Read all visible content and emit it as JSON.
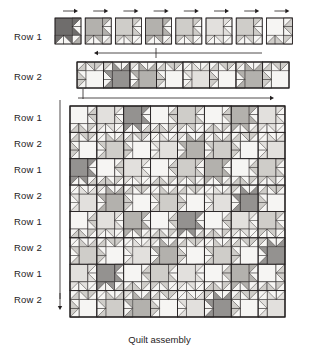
{
  "caption": "Quilt assembly",
  "row_labels": [
    {
      "text": "Row 1"
    },
    {
      "text": "Row 2"
    },
    {
      "text": "Row 1"
    },
    {
      "text": "Row 2"
    },
    {
      "text": "Row 1"
    },
    {
      "text": "Row 2"
    },
    {
      "text": "Row 1"
    },
    {
      "text": "Row 2"
    },
    {
      "text": "Row 1"
    },
    {
      "text": "Row 2"
    }
  ],
  "top_strips": [
    {
      "label": "Row 1",
      "blocks": 8,
      "orientation": "upright",
      "arrow": "right-per-block"
    },
    {
      "label": "Row 2",
      "blocks": 8,
      "orientation": "rotated-180",
      "arrow": "left-long"
    }
  ],
  "palette": {
    "white": "#f6f5f3",
    "light": "#e2e0dd",
    "light_mid": "#cfcdc9",
    "mid": "#b3b1ad",
    "mid_dark": "#949290",
    "dark": "#6f6d6c",
    "darkest": "#4a4848",
    "line": "#231f20",
    "ink": "#262223"
  },
  "quilt": {
    "columns": 8,
    "rows": 8,
    "block_label_pattern": [
      "Row 1",
      "Row 2"
    ],
    "arrow_top": "right",
    "arrow_left": "down"
  },
  "chart_data": {
    "type": "diagram",
    "title": "Quilt assembly",
    "grid": {
      "cols": 8,
      "rows": 8
    },
    "row1_tones": [
      6,
      4,
      3,
      4,
      3,
      2,
      3,
      1
    ],
    "row2_tones": [
      1,
      5,
      4,
      1,
      2,
      1,
      4,
      1
    ],
    "body_tones": [
      [
        1,
        2,
        5,
        1,
        3,
        1,
        4,
        2
      ],
      [
        1,
        3,
        1,
        2,
        4,
        3,
        1,
        2
      ],
      [
        5,
        1,
        2,
        1,
        3,
        4,
        1,
        3
      ],
      [
        2,
        4,
        1,
        3,
        1,
        2,
        5,
        1
      ],
      [
        1,
        2,
        4,
        1,
        5,
        1,
        2,
        3
      ],
      [
        3,
        1,
        2,
        4,
        1,
        3,
        1,
        5
      ],
      [
        2,
        5,
        1,
        3,
        2,
        1,
        4,
        1
      ],
      [
        1,
        3,
        4,
        1,
        2,
        5,
        1,
        2
      ]
    ]
  }
}
